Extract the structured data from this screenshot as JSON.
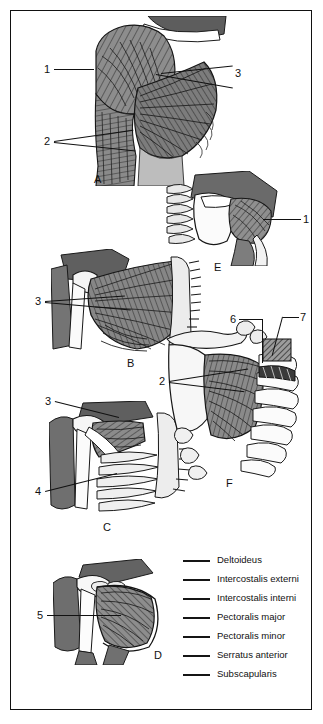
{
  "figure": {
    "kind": "anatomical-plate",
    "background": "#ffffff",
    "frame_color": "#111111",
    "ink_color": "#111111"
  },
  "panels": [
    {
      "letter": "A",
      "x": 83,
      "y": 162,
      "caption": "anterior shoulder, superficial muscles"
    },
    {
      "letter": "B",
      "x": 116,
      "y": 352,
      "caption": "pectoralis major, costal origin"
    },
    {
      "letter": "C",
      "x": 92,
      "y": 516,
      "caption": "pectoralis minor and intercostals"
    },
    {
      "letter": "D",
      "x": 143,
      "y": 645,
      "caption": "subscapularis, anterior scapula"
    },
    {
      "letter": "E",
      "x": 203,
      "y": 257,
      "caption": "deltoideus, posterior scapula"
    },
    {
      "letter": "F",
      "x": 215,
      "y": 472,
      "caption": "serratus anterior and intercostals"
    }
  ],
  "callouts": [
    {
      "id": "a1",
      "number": "1",
      "x": 33,
      "y": 52,
      "panel": "A"
    },
    {
      "id": "a2",
      "number": "2",
      "x": 33,
      "y": 124,
      "panel": "A"
    },
    {
      "id": "a3",
      "number": "3",
      "x": 224,
      "y": 56,
      "panel": "A"
    },
    {
      "id": "e1",
      "number": "1",
      "x": 292,
      "y": 202,
      "panel": "E"
    },
    {
      "id": "b3",
      "number": "3",
      "x": 24,
      "y": 284,
      "panel": "B"
    },
    {
      "id": "c3",
      "number": "3",
      "x": 34,
      "y": 384,
      "panel": "C"
    },
    {
      "id": "c4",
      "number": "4",
      "x": 24,
      "y": 474,
      "panel": "C"
    },
    {
      "id": "f2",
      "number": "2",
      "x": 148,
      "y": 364,
      "panel": "F"
    },
    {
      "id": "f6",
      "number": "6",
      "x": 219,
      "y": 302,
      "panel": "F"
    },
    {
      "id": "f7",
      "number": "7",
      "x": 289,
      "y": 300,
      "panel": "F"
    },
    {
      "id": "d5",
      "number": "5",
      "x": 26,
      "y": 598,
      "panel": "D"
    }
  ],
  "legend": {
    "dash_color": "#151515",
    "items": [
      {
        "key": "1",
        "label": "Deltoideus"
      },
      {
        "key": "2",
        "label": "Intercostalis externi"
      },
      {
        "key": "3",
        "label": "Intercostalis interni"
      },
      {
        "key": "4",
        "label": "Pectoralis major"
      },
      {
        "key": "5",
        "label": "Pectoralis minor"
      },
      {
        "key": "6",
        "label": "Serratus anterior"
      },
      {
        "key": "7",
        "label": "Subscapularis"
      }
    ]
  }
}
